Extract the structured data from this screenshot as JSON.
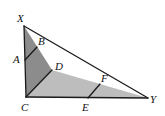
{
  "diagram": {
    "type": "geometry-triangle",
    "colors": {
      "dark_region": "#8c8c8c",
      "light_region": "#bdbdbd",
      "stroke": "#1a1a1a",
      "background": "#ffffff"
    },
    "points": {
      "X": {
        "label": "X",
        "x": 24,
        "y": 26
      },
      "B": {
        "label": "B",
        "x": 36,
        "y": 47
      },
      "A": {
        "label": "A",
        "x": 25,
        "y": 60
      },
      "D": {
        "label": "D",
        "x": 52,
        "y": 70
      },
      "C": {
        "label": "C",
        "x": 26,
        "y": 97
      },
      "F": {
        "label": "F",
        "x": 100,
        "y": 84
      },
      "E": {
        "label": "E",
        "x": 88,
        "y": 98
      },
      "Y": {
        "label": "Y",
        "x": 148,
        "y": 98
      }
    },
    "segments": [
      "XC",
      "XY",
      "CY",
      "AB",
      "CD",
      "EF"
    ],
    "regions": [
      {
        "name": "triangle-XCD",
        "shade": "dark"
      },
      {
        "name": "triangle-CDY",
        "shade": "light"
      }
    ]
  }
}
